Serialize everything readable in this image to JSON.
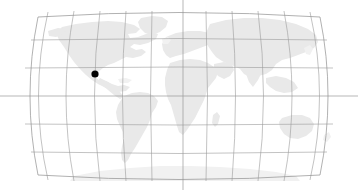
{
  "figure": {
    "kind": "world-locator-map",
    "title": "",
    "width": 358,
    "height": 190,
    "background_color": "#ffffff"
  },
  "map": {
    "projection": "robinson",
    "central_meridian_degrees": 0,
    "land_color": "#e9e9e9",
    "graticule_color": "#9a9a9a",
    "outline_color": "#8f8f8f",
    "ocean_color": "#ffffff",
    "extent": {
      "left_px": 22,
      "right_px": 336,
      "top_px": 11,
      "bottom_px": 181,
      "center_x_px": 179,
      "center_y_px": 96
    }
  },
  "graticule": {
    "meridian_interval_degrees": 30,
    "parallel_interval_degrees": 30,
    "meridian_longitudes": [
      -180,
      -150,
      -120,
      -90,
      -60,
      -30,
      0,
      30,
      60,
      90,
      120,
      150,
      180
    ],
    "parallel_latitudes": [
      90,
      60,
      30,
      0,
      -30,
      -60,
      -90
    ],
    "parallel_y_px": [
      11,
      40,
      68,
      96,
      124,
      152,
      181
    ],
    "equator_extends_full_width": true,
    "central_meridian_extends_full_height": true,
    "grid_on": true
  },
  "markers": [
    {
      "name": "location-marker",
      "label": "",
      "shape": "circle",
      "color": "#000000",
      "radius_px": 3.6,
      "x_px": 95,
      "y_px": 74,
      "approx_longitude": -97,
      "approx_latitude": 24
    }
  ],
  "legend": {
    "visible": false,
    "entries": []
  },
  "labels": {
    "axis_tick_labels": [],
    "annotations": []
  },
  "chart_data": {
    "type": "scatter",
    "title": "",
    "xlabel": "Longitude",
    "ylabel": "Latitude",
    "xlim": [
      -180,
      180
    ],
    "ylim": [
      -90,
      90
    ],
    "grid": true,
    "series": [
      {
        "name": "location-marker",
        "color": "#000000",
        "x": [
          -97
        ],
        "y": [
          24
        ]
      }
    ]
  }
}
